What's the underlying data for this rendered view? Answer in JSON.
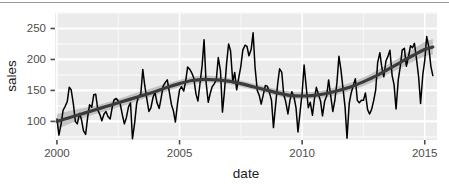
{
  "chart_data": {
    "type": "line",
    "title": "",
    "xlabel": "date",
    "ylabel": "sales",
    "xlim": [
      1999.92,
      2015.5
    ],
    "ylim": [
      70,
      275
    ],
    "grid": true,
    "legend": "none",
    "x_ticks": [
      2000,
      2005,
      2010,
      2015
    ],
    "x_tick_labels": [
      "2000",
      "2005",
      "2010",
      "2015"
    ],
    "y_ticks": [
      100,
      150,
      200,
      250
    ],
    "y_tick_labels": [
      "100",
      "150",
      "200",
      "250"
    ],
    "x_minor_ticks": [
      2002.5,
      2007.5,
      2012.5
    ],
    "y_minor_ticks": [
      75,
      125,
      175,
      225,
      275
    ],
    "series": [
      {
        "name": "sales",
        "kind": "observed-line",
        "color": "#000000",
        "x": [
          2000.0,
          2000.08,
          2000.17,
          2000.25,
          2000.33,
          2000.42,
          2000.5,
          2000.58,
          2000.67,
          2000.75,
          2000.83,
          2000.92,
          2001.0,
          2001.08,
          2001.17,
          2001.25,
          2001.33,
          2001.42,
          2001.5,
          2001.58,
          2001.67,
          2001.75,
          2001.83,
          2001.92,
          2002.0,
          2002.08,
          2002.17,
          2002.25,
          2002.33,
          2002.42,
          2002.5,
          2002.58,
          2002.67,
          2002.75,
          2002.83,
          2002.92,
          2003.0,
          2003.08,
          2003.17,
          2003.25,
          2003.33,
          2003.42,
          2003.5,
          2003.58,
          2003.67,
          2003.75,
          2003.83,
          2003.92,
          2004.0,
          2004.08,
          2004.17,
          2004.25,
          2004.33,
          2004.42,
          2004.5,
          2004.58,
          2004.67,
          2004.75,
          2004.83,
          2004.92,
          2005.0,
          2005.08,
          2005.17,
          2005.25,
          2005.33,
          2005.42,
          2005.5,
          2005.58,
          2005.67,
          2005.75,
          2005.83,
          2005.92,
          2006.0,
          2006.08,
          2006.17,
          2006.25,
          2006.33,
          2006.42,
          2006.5,
          2006.58,
          2006.67,
          2006.75,
          2006.83,
          2006.92,
          2007.0,
          2007.08,
          2007.17,
          2007.25,
          2007.33,
          2007.42,
          2007.5,
          2007.58,
          2007.67,
          2007.75,
          2007.83,
          2007.92,
          2008.0,
          2008.08,
          2008.17,
          2008.25,
          2008.33,
          2008.42,
          2008.5,
          2008.58,
          2008.67,
          2008.75,
          2008.83,
          2008.92,
          2009.0,
          2009.08,
          2009.17,
          2009.25,
          2009.33,
          2009.42,
          2009.5,
          2009.58,
          2009.67,
          2009.75,
          2009.83,
          2009.92,
          2010.0,
          2010.08,
          2010.17,
          2010.25,
          2010.33,
          2010.42,
          2010.5,
          2010.58,
          2010.67,
          2010.75,
          2010.83,
          2010.92,
          2011.0,
          2011.08,
          2011.17,
          2011.25,
          2011.33,
          2011.42,
          2011.5,
          2011.58,
          2011.67,
          2011.75,
          2011.83,
          2011.92,
          2012.0,
          2012.08,
          2012.17,
          2012.25,
          2012.33,
          2012.42,
          2012.5,
          2012.58,
          2012.67,
          2012.75,
          2012.83,
          2012.92,
          2013.0,
          2013.08,
          2013.17,
          2013.25,
          2013.33,
          2013.42,
          2013.5,
          2013.58,
          2013.67,
          2013.75,
          2013.83,
          2013.92,
          2014.0,
          2014.08,
          2014.17,
          2014.25,
          2014.33,
          2014.42,
          2014.5,
          2014.58,
          2014.67,
          2014.75,
          2014.83,
          2014.92,
          2015.0,
          2015.08,
          2015.17,
          2015.25,
          2015.33
        ],
        "y": [
          104,
          78,
          96,
          118,
          124,
          132,
          155,
          151,
          128,
          100,
          96,
          113,
          103,
          85,
          79,
          106,
          127,
          123,
          143,
          144,
          118,
          111,
          101,
          112,
          116,
          108,
          104,
          122,
          135,
          137,
          133,
          128,
          110,
          96,
          106,
          124,
          130,
          72,
          98,
          129,
          141,
          144,
          184,
          158,
          135,
          116,
          122,
          139,
          147,
          130,
          121,
          138,
          157,
          163,
          167,
          148,
          127,
          117,
          99,
          130,
          151,
          156,
          149,
          165,
          188,
          184,
          178,
          170,
          144,
          133,
          160,
          190,
          232,
          164,
          131,
          145,
          156,
          161,
          168,
          203,
          181,
          115,
          148,
          194,
          225,
          214,
          164,
          179,
          151,
          172,
          189,
          215,
          223,
          221,
          206,
          216,
          243,
          187,
          150,
          142,
          128,
          144,
          158,
          157,
          146,
          134,
          90,
          128,
          160,
          185,
          179,
          143,
          132,
          112,
          133,
          148,
          139,
          122,
          83,
          117,
          146,
          191,
          154,
          122,
          131,
          110,
          136,
          155,
          143,
          133,
          109,
          133,
          141,
          167,
          140,
          116,
          133,
          163,
          205,
          184,
          152,
          123,
          73,
          129,
          146,
          157,
          169,
          134,
          130,
          134,
          134,
          146,
          119,
          112,
          119,
          134,
          151,
          195,
          211,
          187,
          172,
          198,
          205,
          215,
          174,
          159,
          120,
          167,
          188,
          215,
          218,
          189,
          203,
          222,
          219,
          226,
          199,
          172,
          129,
          175,
          198,
          237,
          219,
          189,
          174
        ]
      },
      {
        "name": "loess smooth",
        "kind": "smooth-trend",
        "color": "#3b3b3b",
        "x": [
          2000.0,
          2000.5,
          2001.0,
          2001.5,
          2002.0,
          2002.5,
          2003.0,
          2003.5,
          2004.0,
          2004.5,
          2005.0,
          2005.5,
          2006.0,
          2006.5,
          2007.0,
          2007.5,
          2008.0,
          2008.5,
          2009.0,
          2009.5,
          2010.0,
          2010.5,
          2011.0,
          2011.5,
          2012.0,
          2012.5,
          2013.0,
          2013.5,
          2014.0,
          2014.5,
          2015.0,
          2015.33
        ],
        "y": [
          100,
          106,
          112,
          118,
          124,
          130,
          136,
          142,
          148,
          155,
          161,
          166,
          168,
          167,
          165,
          161,
          156,
          151,
          146,
          142,
          141,
          142,
          145,
          150,
          156,
          164,
          173,
          184,
          195,
          206,
          216,
          220
        ],
        "ribbon_lower": [
          88,
          96,
          104,
          111,
          117,
          123,
          129,
          136,
          142,
          149,
          155,
          160,
          163,
          162,
          160,
          156,
          151,
          146,
          141,
          137,
          136,
          137,
          139,
          144,
          150,
          157,
          166,
          176,
          186,
          196,
          205,
          208
        ],
        "ribbon_upper": [
          112,
          117,
          121,
          125,
          130,
          136,
          143,
          149,
          155,
          161,
          167,
          172,
          174,
          173,
          170,
          166,
          161,
          156,
          152,
          148,
          147,
          148,
          151,
          157,
          163,
          171,
          181,
          192,
          204,
          216,
          228,
          233
        ],
        "ribbon_color": "#b3b3b3"
      }
    ]
  },
  "panel": {
    "background_color": "#ebebeb",
    "gridline_major_color": "#ffffff",
    "gridline_minor_color": "#f7f7f7"
  },
  "axes": {
    "tick_color": "#4d4d4d",
    "label_color": "#1a1a1a"
  }
}
